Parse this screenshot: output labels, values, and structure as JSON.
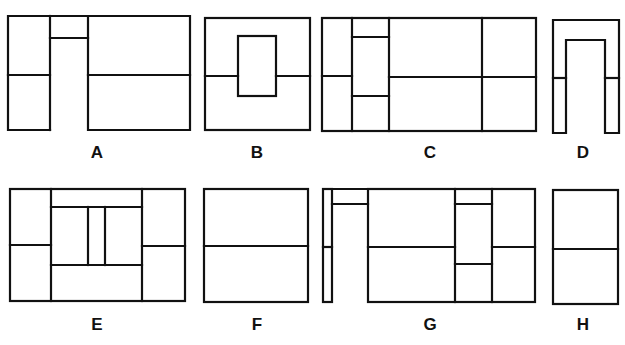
{
  "figure": {
    "line_color": "#111111",
    "background": "#ffffff",
    "panels": [
      {
        "label": "A",
        "label_pos": [
          97,
          158
        ]
      },
      {
        "label": "B",
        "label_pos": [
          257,
          158
        ]
      },
      {
        "label": "C",
        "label_pos": [
          430,
          158
        ]
      },
      {
        "label": "D",
        "label_pos": [
          583,
          158
        ]
      },
      {
        "label": "E",
        "label_pos": [
          97,
          330
        ]
      },
      {
        "label": "F",
        "label_pos": [
          257,
          330
        ]
      },
      {
        "label": "G",
        "label_pos": [
          430,
          330
        ]
      },
      {
        "label": "H",
        "label_pos": [
          583,
          330
        ]
      }
    ]
  }
}
